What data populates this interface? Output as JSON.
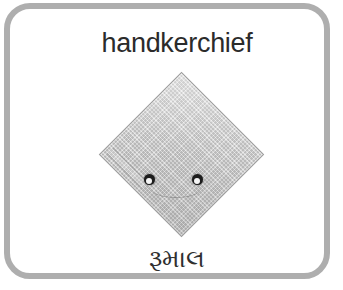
{
  "card": {
    "title": "handkerchief",
    "translation": "રૂમાલ",
    "translation_language": "Gujarati",
    "border_color": "#aeaeae",
    "background_color": "#ffffff",
    "title_color": "#2b2b2b"
  },
  "illustration": {
    "name": "folded-handkerchief",
    "shape": "diamond",
    "cloth_color": "#c6c6c6",
    "cloth_outline_color": "#9a9a9a",
    "dot_color": "#1d1d1d",
    "dot_highlight_color": "#f4f4f4",
    "dot_count": 2
  }
}
